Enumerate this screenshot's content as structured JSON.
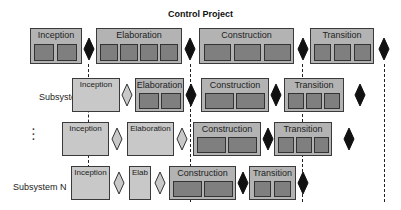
{
  "title": "Control Project",
  "rows": [
    {
      "label": "",
      "phases": [
        {
          "label": "Inception",
          "iterations": 2
        },
        {
          "label": "Elaboration",
          "iterations": 4
        },
        {
          "label": "Construction",
          "iterations": 3
        },
        {
          "label": "Transition",
          "iterations": 3
        }
      ],
      "milestones": [
        "filled",
        "filled",
        "filled",
        "filled"
      ]
    },
    {
      "label": "Subsystem 1",
      "phases": [
        {
          "label": "Inception",
          "iterations": 0
        },
        {
          "label": "Elaboration",
          "iterations": 2
        },
        {
          "label": "Construction",
          "iterations": 2
        },
        {
          "label": "Transition",
          "iterations": 3
        }
      ],
      "milestones": [
        "hollow",
        "filled",
        "filled",
        "filled"
      ]
    },
    {
      "label": "⋮",
      "phases": [
        {
          "label": "Inception",
          "iterations": 0
        },
        {
          "label": "Elaboration",
          "iterations": 0
        },
        {
          "label": "Construction",
          "iterations": 2
        },
        {
          "label": "Transition",
          "iterations": 3
        }
      ],
      "milestones": [
        "hollow",
        "hollow",
        "filled",
        "filled"
      ]
    },
    {
      "label": "Subsystem N",
      "phases": [
        {
          "label": "Inception",
          "iterations": 0
        },
        {
          "label": "Elab",
          "iterations": 0
        },
        {
          "label": "Construction",
          "iterations": 2
        },
        {
          "label": "Transition",
          "iterations": 2
        }
      ],
      "milestones": [
        "hollow",
        "hollow",
        "filled",
        "filled"
      ]
    }
  ],
  "colors": {
    "milestone_filled": "#111111",
    "milestone_hollow": "#c8c8c8",
    "phase_fill": "#b3b3b3",
    "iteration_fill": "#7f7f7f"
  }
}
